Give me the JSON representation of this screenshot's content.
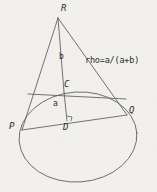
{
  "figure": {
    "type": "geometry-diagram",
    "canvas": {
      "width": 157,
      "height": 192
    },
    "background_color": "#f3f2ef",
    "ink_color": "#4a4a4a",
    "label_color": "#2b2b2b"
  },
  "labels": {
    "apex": {
      "text": "R",
      "x": 61,
      "y": 4
    },
    "left_base": {
      "text": "P",
      "x": 9,
      "y": 122
    },
    "right_base": {
      "text": "Q",
      "x": 129,
      "y": 106
    },
    "center": {
      "text": "C",
      "x": 64,
      "y": 80
    },
    "foot": {
      "text": "D",
      "x": 63,
      "y": 123
    },
    "upper_segment": {
      "text": "b",
      "x": 59,
      "y": 53
    },
    "lower_segment": {
      "text": "a",
      "x": 53,
      "y": 100
    },
    "formula": {
      "text": "rho=a/(a+b)",
      "x": 85,
      "y": 56
    }
  },
  "points": {
    "R": {
      "x": 58,
      "y": 18
    },
    "P": {
      "x": 22,
      "y": 130
    },
    "Q": {
      "x": 127,
      "y": 115
    },
    "C": {
      "x": 64,
      "y": 92
    },
    "D": {
      "x": 67,
      "y": 121
    }
  },
  "ellipse": {
    "cx": 78,
    "cy": 137,
    "rx": 59,
    "ry": 45,
    "rotation": -4
  },
  "segments": [
    {
      "name": "side-RP",
      "from": "R",
      "to": "P"
    },
    {
      "name": "side-RQ",
      "from": "R",
      "to": "Q"
    },
    {
      "name": "axis-RD",
      "from": "R",
      "to": "D"
    },
    {
      "name": "base-PQ",
      "from": "P",
      "to": "Q"
    },
    {
      "name": "chord-through-C",
      "from": {
        "x": 28,
        "y": 94
      },
      "to": {
        "x": 126,
        "y": 99
      }
    }
  ],
  "markers": {
    "right_angle_at_D": {
      "x": 67,
      "y": 121,
      "size": 5
    }
  }
}
